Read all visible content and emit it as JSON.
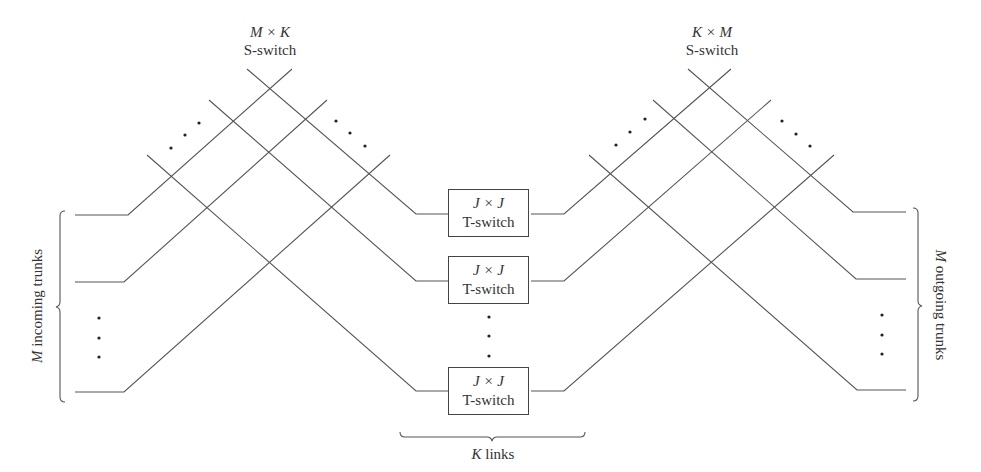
{
  "left_switch": {
    "dims": "M × K",
    "type": "S-switch"
  },
  "right_switch": {
    "dims": "K × M",
    "type": "S-switch"
  },
  "t_switches": [
    {
      "dims": "J × J",
      "type": "T-switch"
    },
    {
      "dims": "J × J",
      "type": "T-switch"
    },
    {
      "dims": "J × J",
      "type": "T-switch"
    }
  ],
  "left_brace_label": {
    "var": "M",
    "text": " incoming trunks"
  },
  "right_brace_label": {
    "var": "M",
    "text": " outgoing trunks"
  },
  "bottom_brace_label": {
    "var": "K",
    "text": " links"
  },
  "colors": {
    "line": "#555555",
    "text": "#333333",
    "background": "#ffffff"
  }
}
